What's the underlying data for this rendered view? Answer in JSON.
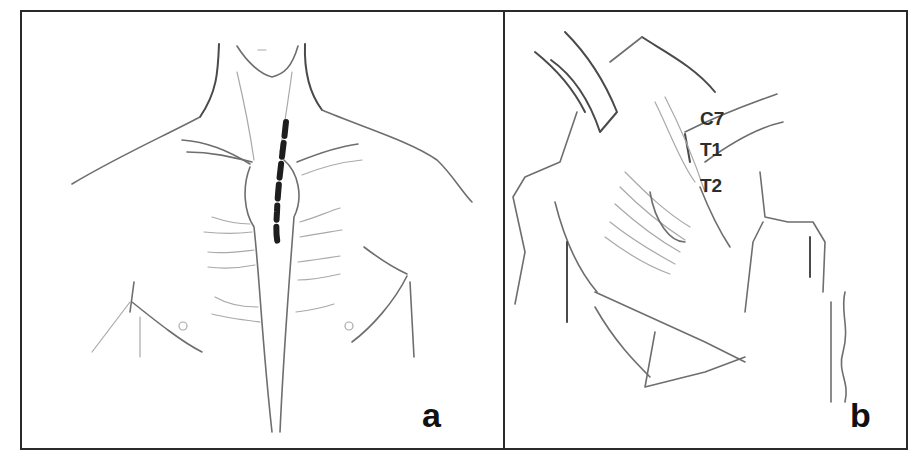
{
  "figure": {
    "panels": [
      {
        "id": "a",
        "label": "a",
        "content": "anterior chest and neck sketch with dashed incision line along the sternal/paramedian neck region"
      },
      {
        "id": "b",
        "label": "b",
        "content": "retracted surgical exposure of the cervicothoracic spine",
        "vertebra_labels": [
          "C7",
          "T1",
          "T2"
        ]
      }
    ],
    "colors": {
      "border": "#2a2a2a",
      "sketch": "#6e6e6e",
      "incision": "#1e1e1e",
      "label": "#111111"
    }
  }
}
